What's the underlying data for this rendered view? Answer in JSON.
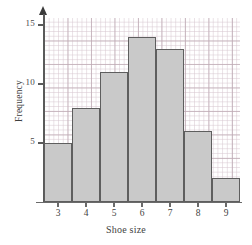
{
  "chart_data": {
    "type": "bar",
    "title": "",
    "xlabel": "Shoe size",
    "ylabel": "Frequency",
    "categories": [
      "3",
      "4",
      "5",
      "6",
      "7",
      "8",
      "9"
    ],
    "values": [
      5,
      8,
      11,
      14,
      13,
      6,
      2
    ],
    "x_tick_labels": [
      "3",
      "4",
      "5",
      "6",
      "7",
      "8",
      "9"
    ],
    "y_tick_labels": [
      "5",
      "10",
      "15"
    ],
    "y_ticks": [
      5,
      10,
      15
    ],
    "ylim": [
      0,
      15.6
    ],
    "xlim": [
      2.5,
      9.5
    ],
    "grid": true,
    "grid_style": "graph-paper",
    "legend": "none",
    "bar_fill_color": "#c9c9c9",
    "bar_edge_color": "#5e5e5e",
    "axis_color": "#5a5a5a",
    "grid_major_color": "#beaab4",
    "grid_minor_color": "#d7c8d0",
    "y_axis_arrow": true
  }
}
